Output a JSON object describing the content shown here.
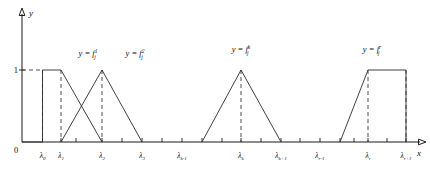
{
  "figure": {
    "title": "",
    "axis": {
      "y_label": "y",
      "x_label": "x",
      "origin_label": "0",
      "unit_label": "1"
    }
  },
  "chart_data": {
    "type": "line",
    "title": "",
    "xlabel": "x",
    "ylabel": "y",
    "xlim": [
      0,
      430
    ],
    "ylim": [
      0,
      1
    ],
    "grid": false,
    "legend": "none",
    "tick_labels": [
      "λ0",
      "λ1",
      "λ2",
      "λ3",
      "λk-1",
      "λk",
      "λk+1",
      "λr-1",
      "λr",
      "λr+1"
    ],
    "tick_label_parts": [
      {
        "base": "λ",
        "sub": "0",
        "x": 42.5
      },
      {
        "base": "λ",
        "sub": "1",
        "x": 61.0
      },
      {
        "base": "λ",
        "sub": "2",
        "x": 102.0
      },
      {
        "base": "λ",
        "sub": "3",
        "x": 142.0
      },
      {
        "base": "λ",
        "sub": "k-1",
        "x": 182.0
      },
      {
        "base": "λ",
        "sub": "k",
        "x": 241.0
      },
      {
        "base": "λ",
        "sub": "k+1",
        "x": 281.0
      },
      {
        "base": "λ",
        "sub": "r-1",
        "x": 320.0
      },
      {
        "base": "λ",
        "sub": "r",
        "x": 368.0
      },
      {
        "base": "λ",
        "sub": "r+1",
        "x": 406.0
      }
    ],
    "series": [
      {
        "name": "f_j^1",
        "shape": "trapezoid",
        "label_parts": {
          "prefix": "y = ",
          "base": "f",
          "sup": "1",
          "sub": "j"
        },
        "label_x": 88,
        "label_y": 56,
        "points": [
          [
            22,
            142
          ],
          [
            42.5,
            142
          ],
          [
            42.5,
            70
          ],
          [
            61.0,
            70
          ],
          [
            102.0,
            142
          ]
        ],
        "plateau": [
          [
            42.5,
            70
          ],
          [
            61.0,
            70
          ]
        ],
        "peak_value": 1
      },
      {
        "name": "f_j^2",
        "shape": "triangle",
        "label_parts": {
          "prefix": "y = ",
          "base": "f",
          "sup": "2",
          "sub": "j"
        },
        "label_x": 135,
        "label_y": 56,
        "points": [
          [
            61.0,
            142
          ],
          [
            102.0,
            70
          ],
          [
            142.0,
            142
          ]
        ],
        "peak_value": 1
      },
      {
        "name": "f_j^k",
        "shape": "triangle",
        "label_parts": {
          "prefix": "y = ",
          "base": "f",
          "sup": "k",
          "sub": "j"
        },
        "label_x": 241,
        "label_y": 52,
        "points": [
          [
            202.0,
            142
          ],
          [
            241.0,
            70
          ],
          [
            281.0,
            142
          ]
        ],
        "peak_value": 1
      },
      {
        "name": "f_j^r",
        "shape": "trapezoid",
        "label_parts": {
          "prefix": "y = ",
          "base": "f",
          "sup": "r",
          "sub": "j"
        },
        "label_x": 372,
        "label_y": 52,
        "points": [
          [
            340.0,
            142
          ],
          [
            368.0,
            70
          ],
          [
            406.0,
            70
          ],
          [
            406.0,
            142
          ]
        ],
        "plateau": [
          [
            368.0,
            70
          ],
          [
            406.0,
            70
          ]
        ],
        "peak_value": 1
      }
    ],
    "dashed_guides": [
      [
        [
          22,
          70
        ],
        [
          42.5,
          70
        ]
      ],
      [
        [
          42.5,
          70
        ],
        [
          42.5,
          142
        ]
      ],
      [
        [
          61.0,
          70
        ],
        [
          61.0,
          142
        ]
      ],
      [
        [
          102.0,
          70
        ],
        [
          102.0,
          142
        ]
      ],
      [
        [
          241.0,
          70
        ],
        [
          241.0,
          142
        ]
      ],
      [
        [
          368.0,
          70
        ],
        [
          368.0,
          142
        ]
      ],
      [
        [
          406.0,
          70
        ],
        [
          406.0,
          142
        ]
      ]
    ],
    "tick_positions": [
      42.5,
      61.0,
      76.0,
      102.0,
      122.0,
      142.0,
      162.0,
      182.0,
      202.0,
      222.0,
      241.0,
      261.0,
      281.0,
      300.0,
      320.0,
      340.0,
      354.0,
      368.0,
      387.0,
      406.0
    ]
  }
}
